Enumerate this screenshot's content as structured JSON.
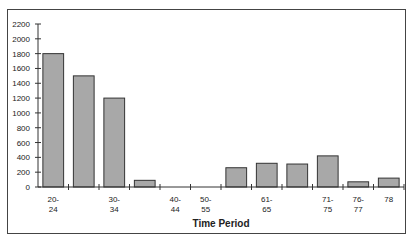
{
  "chart_data": {
    "type": "bar",
    "title": "",
    "xlabel": "Time Period",
    "ylabel": "",
    "ylim": [
      0,
      2200
    ],
    "yticks": [
      0,
      200,
      400,
      600,
      800,
      1000,
      1200,
      1400,
      1600,
      1800,
      2000,
      2200
    ],
    "categories": [
      "20-24",
      "",
      "30-34",
      "",
      "40-44",
      "50-55",
      "",
      "61-65",
      "",
      "71-75",
      "76-77",
      "78"
    ],
    "values": [
      1800,
      1500,
      1200,
      90,
      0,
      0,
      260,
      320,
      310,
      420,
      70,
      120
    ],
    "bar_color": "#a8a8a8",
    "grid": false,
    "legend": false
  }
}
